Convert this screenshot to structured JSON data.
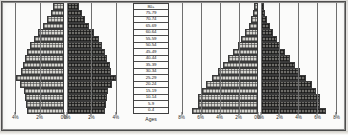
{
  "chart_data": {
    "type": "bar",
    "title": "",
    "subtitle": "",
    "xlabel": "",
    "ylabel": "Ages",
    "orientation": "horizontal-population-pyramid",
    "grid": true,
    "legend_position": "none",
    "age_groups": [
      "80+",
      "75-79",
      "70-74",
      "65-69",
      "60-64",
      "55-59",
      "50-54",
      "45-49",
      "40-44",
      "35-39",
      "30-34",
      "25-29",
      "20-24",
      "15-19",
      "10-14",
      "5-9",
      "0-4"
    ],
    "panels": [
      {
        "name": "left-panel",
        "xlim": [
          0,
          5
        ],
        "ticks_left": [
          "4%",
          "2%",
          "0%"
        ],
        "ticks_right": [
          "0%",
          "2%",
          "4%"
        ],
        "tick_values_left": [
          4,
          2,
          0
        ],
        "tick_values_right": [
          0,
          2,
          4
        ],
        "series": [
          {
            "name": "left-side",
            "side": "left",
            "fill": "light-hatched",
            "values": [
              0.9,
              1.1,
              1.4,
              1.7,
              2.1,
              2.5,
              2.8,
              3.0,
              3.2,
              3.4,
              3.5,
              3.9,
              3.6,
              3.3,
              3.2,
              3.1,
              3.0
            ]
          },
          {
            "name": "right-side",
            "side": "right",
            "fill": "dark-hatched",
            "values": [
              1.0,
              1.2,
              1.5,
              1.8,
              2.2,
              2.6,
              2.9,
              3.1,
              3.3,
              3.5,
              3.6,
              4.0,
              3.7,
              3.4,
              3.3,
              3.2,
              3.1
            ]
          }
        ]
      },
      {
        "name": "right-panel",
        "xlim": [
          0,
          8.8
        ],
        "ticks_left": [
          "8%",
          "6%",
          "4%",
          "2%",
          "0%"
        ],
        "ticks_right": [
          "0%",
          "2%",
          "4%",
          "6%",
          "8%"
        ],
        "tick_values_left": [
          8,
          6,
          4,
          2,
          0
        ],
        "tick_values_right": [
          0,
          2,
          4,
          6,
          8
        ],
        "series": [
          {
            "name": "left-side",
            "side": "left",
            "fill": "light-hatched",
            "values": [
              0.35,
              0.5,
              0.7,
              0.95,
              1.3,
              1.7,
              2.1,
              2.6,
              3.1,
              3.6,
              4.2,
              4.8,
              5.4,
              5.9,
              6.3,
              6.3,
              6.9
            ]
          },
          {
            "name": "right-side",
            "side": "right",
            "fill": "dark-hatched",
            "values": [
              0.35,
              0.5,
              0.7,
              0.95,
              1.3,
              1.7,
              2.1,
              2.6,
              3.1,
              3.6,
              4.2,
              4.8,
              5.4,
              5.9,
              6.3,
              6.3,
              6.9
            ]
          }
        ]
      }
    ]
  },
  "ages_column": {
    "header": "Ages",
    "cells": [
      "80+",
      "75-79",
      "70-74",
      "65-69",
      "60-64",
      "55-59",
      "50-54",
      "45-49",
      "40-44",
      "35-39",
      "30-34",
      "25-29",
      "20-24",
      "15-19",
      "10-14",
      "5-9",
      "0-4"
    ]
  },
  "colors": {
    "light_fill": "#d5d4cf",
    "dark_fill": "#6d6c68",
    "bar_outline": "#3a3a3a",
    "gridline": "#6f6f6f",
    "background": "#fbfbfa",
    "text": "#1d1d1d"
  }
}
